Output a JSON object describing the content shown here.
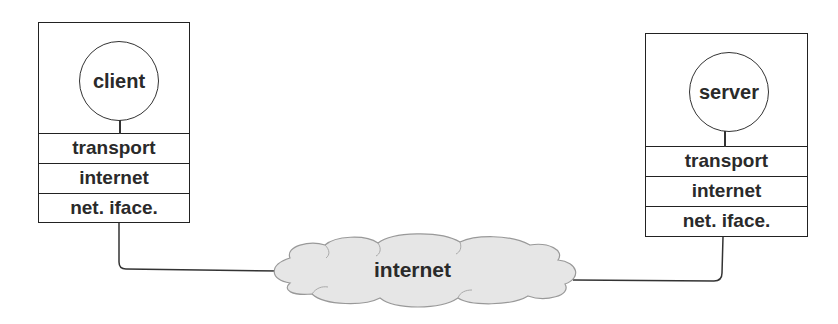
{
  "diagram": {
    "client_host": {
      "application": "client",
      "layers": [
        "transport",
        "internet",
        "net. iface."
      ]
    },
    "server_host": {
      "application": "server",
      "layers": [
        "transport",
        "internet",
        "net. iface."
      ]
    },
    "network": {
      "label": "internet"
    },
    "colors": {
      "line": "#333333",
      "cloud_fill": "#e6e6e6",
      "cloud_stroke": "#999999",
      "text": "#2a2a2a"
    }
  }
}
